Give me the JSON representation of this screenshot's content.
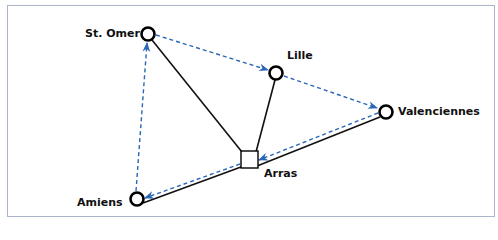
{
  "diagram": {
    "colors": {
      "solid_edge": "#111111",
      "dashed_edge": "#2a66b8",
      "frame": "#aab4c8"
    },
    "nodes": [
      {
        "id": "st-omer",
        "label": "St. Omer",
        "shape": "circle",
        "x": 148,
        "y": 34
      },
      {
        "id": "lille",
        "label": "Lille",
        "shape": "circle",
        "x": 276,
        "y": 73
      },
      {
        "id": "valenciennes",
        "label": "Valenciennes",
        "shape": "circle",
        "x": 386,
        "y": 112
      },
      {
        "id": "arras",
        "label": "Arras",
        "shape": "square",
        "x": 249,
        "y": 160
      },
      {
        "id": "amiens",
        "label": "Amiens",
        "shape": "circle",
        "x": 137,
        "y": 199
      }
    ],
    "solid_edges": [
      {
        "from": "st-omer",
        "to": "arras"
      },
      {
        "from": "lille",
        "to": "arras"
      },
      {
        "from": "valenciennes",
        "to": "arras"
      },
      {
        "from": "arras",
        "to": "amiens"
      }
    ],
    "dashed_arrows": [
      {
        "from": "st-omer",
        "to": "lille"
      },
      {
        "from": "lille",
        "to": "valenciennes"
      },
      {
        "from": "valenciennes",
        "to": "arras"
      },
      {
        "from": "arras",
        "to": "amiens"
      },
      {
        "from": "amiens",
        "to": "st-omer"
      }
    ]
  }
}
